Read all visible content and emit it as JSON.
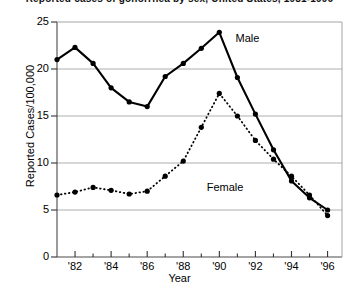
{
  "chart_data": {
    "type": "line",
    "title": "Reported cases of gonorrhea by sex, United States, 1981-1996",
    "xlabel": "Year",
    "ylabel": "Reported Cases/100,000",
    "xlim": [
      1981,
      1996.8
    ],
    "ylim": [
      0,
      25
    ],
    "yticks": [
      0,
      5,
      10,
      15,
      20,
      25
    ],
    "ytick_labels": [
      "0",
      "5",
      "10",
      "15",
      "20",
      "25"
    ],
    "xticks": [
      1982,
      1984,
      1986,
      1988,
      1990,
      1992,
      1994,
      1996
    ],
    "xtick_labels": [
      "'82",
      "'84",
      "'86",
      "'88",
      "'90",
      "'92",
      "'94",
      "'96"
    ],
    "xminor_ticks": [
      1983,
      1985,
      1987,
      1989,
      1991,
      1993,
      1995
    ],
    "grid": "horizontal",
    "grid_color": "#9a9a9a",
    "legend_position": "inline-annotations",
    "x": [
      1981,
      1982,
      1983,
      1984,
      1985,
      1986,
      1987,
      1988,
      1989,
      1990,
      1991,
      1992,
      1993,
      1994,
      1995,
      1996
    ],
    "series": [
      {
        "name": "Male",
        "label": "Male",
        "color": "#000000",
        "linestyle": "solid",
        "marker": "circle",
        "values": [
          21.0,
          22.3,
          20.6,
          18.0,
          16.5,
          16.0,
          19.2,
          20.6,
          22.2,
          23.9,
          19.1,
          15.2,
          11.4,
          8.1,
          6.3,
          5.0
        ]
      },
      {
        "name": "Female",
        "label": "Female",
        "color": "#000000",
        "linestyle": "dotted",
        "marker": "circle",
        "values": [
          6.6,
          6.9,
          7.4,
          7.1,
          6.7,
          7.0,
          8.6,
          10.2,
          13.8,
          17.4,
          15.0,
          12.4,
          10.4,
          8.6,
          6.6,
          4.4
        ]
      }
    ],
    "annotations": [
      {
        "text": "Male",
        "x": 1990.9,
        "y": 23.2
      },
      {
        "text": "Female",
        "x": 1989.3,
        "y": 7.3
      }
    ]
  }
}
